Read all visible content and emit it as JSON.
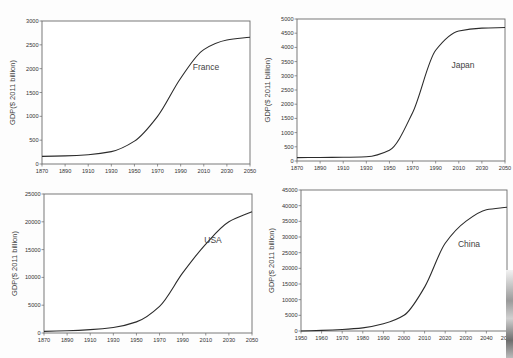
{
  "chart_data": [
    {
      "type": "line",
      "title": "",
      "annotation": "France",
      "xlabel": "",
      "ylabel": "GDP($ 2011 billion)",
      "x": [
        1870,
        1890,
        1910,
        1930,
        1950,
        1970,
        1990,
        2010,
        2030,
        2050
      ],
      "values": [
        160,
        170,
        195,
        260,
        480,
        1000,
        1800,
        2400,
        2600,
        2660
      ],
      "xlim": [
        1870,
        2050
      ],
      "ylim": [
        0,
        3000
      ],
      "xticks": [
        "1870",
        "1890",
        "1910",
        "1930",
        "1950",
        "1970",
        "1990",
        "2010",
        "2030",
        "2050"
      ],
      "yticks": [
        "0",
        "500",
        "1000",
        "1500",
        "2000",
        "2500",
        "3000"
      ],
      "grid": false,
      "legend": "none",
      "frame": {
        "left": 42,
        "top": 21,
        "right": 250,
        "bottom": 164
      },
      "label_pos": [
        206,
        70
      ]
    },
    {
      "type": "line",
      "title": "",
      "annotation": "Japan",
      "xlabel": "",
      "ylabel": "GDP($ 2011 billion)",
      "x": [
        1870,
        1890,
        1910,
        1930,
        1950,
        1970,
        1990,
        2010,
        2030,
        2050
      ],
      "values": [
        120,
        125,
        130,
        150,
        380,
        1700,
        3900,
        4580,
        4680,
        4700
      ],
      "xlim": [
        1870,
        2050
      ],
      "ylim": [
        0,
        5000
      ],
      "xticks": [
        "1870",
        "1890",
        "1910",
        "1930",
        "1950",
        "1970",
        "1990",
        "2010",
        "2030",
        "2050"
      ],
      "yticks": [
        "0",
        "500",
        "1000",
        "1500",
        "2000",
        "2500",
        "3000",
        "3500",
        "4000",
        "4500",
        "5000"
      ],
      "grid": false,
      "legend": "none",
      "frame": {
        "left": 297,
        "top": 19,
        "right": 505,
        "bottom": 161
      },
      "label_pos": [
        463,
        68
      ]
    },
    {
      "type": "line",
      "title": "",
      "annotation": "USA",
      "xlabel": "",
      "ylabel": "GDP($ 2011 billion)",
      "x": [
        1870,
        1890,
        1910,
        1930,
        1950,
        1970,
        1990,
        2010,
        2030,
        2050
      ],
      "values": [
        300,
        400,
        600,
        1000,
        2000,
        4800,
        10800,
        16000,
        20000,
        21800
      ],
      "xlim": [
        1870,
        2050
      ],
      "ylim": [
        0,
        25000
      ],
      "xticks": [
        "1870",
        "1890",
        "1910",
        "1930",
        "1950",
        "1970",
        "1990",
        "2010",
        "2030",
        "2050"
      ],
      "yticks": [
        "0",
        "5000",
        "10000",
        "15000",
        "20000",
        "25000"
      ],
      "grid": false,
      "legend": "none",
      "frame": {
        "left": 44,
        "top": 194,
        "right": 252,
        "bottom": 333
      },
      "label_pos": [
        213,
        243
      ]
    },
    {
      "type": "line",
      "title": "",
      "annotation": "China",
      "xlabel": "",
      "ylabel": "GDP($ 2011 billion)",
      "x": [
        1950,
        1960,
        1970,
        1980,
        1990,
        2000,
        2010,
        2020,
        2030,
        2040,
        2050
      ],
      "values": [
        0,
        200,
        500,
        1000,
        2300,
        5000,
        14000,
        28000,
        35000,
        38700,
        39500
      ],
      "xlim": [
        1950,
        2050
      ],
      "ylim": [
        0,
        45000
      ],
      "xticks": [
        "1950",
        "1960",
        "1970",
        "1980",
        "1990",
        "2000",
        "2010",
        "2020",
        "2030",
        "2040",
        "2050"
      ],
      "yticks": [
        "0",
        "5000",
        "10000",
        "15000",
        "20000",
        "25000",
        "30000",
        "35000",
        "40000",
        "45000"
      ],
      "grid": false,
      "legend": "none",
      "frame": {
        "left": 301,
        "top": 190,
        "right": 507,
        "bottom": 331
      },
      "label_pos": [
        469,
        247
      ]
    }
  ],
  "labels": {
    "france": "France",
    "japan": "Japan",
    "usa": "USA",
    "china": "China",
    "ylabel": "GDP($ 2011 billion)"
  }
}
